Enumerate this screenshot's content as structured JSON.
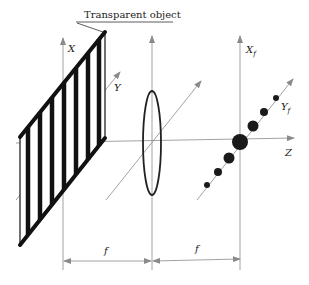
{
  "diagram": {
    "title_label": "Transparent object",
    "axes": {
      "object_x": "X",
      "object_y": "Y",
      "focal_x": "X",
      "focal_x_sub": "f",
      "focal_y": "Y",
      "focal_y_sub": "f",
      "optical_axis": "Z"
    },
    "dimensions": {
      "left_distance": "f",
      "right_distance": "f"
    },
    "elements": [
      "grating",
      "lens",
      "diffraction-spots"
    ],
    "spot_count": 7,
    "colors": {
      "ink": "#222222",
      "thin_line": "#8a8a8a",
      "background": "#ffffff"
    }
  }
}
